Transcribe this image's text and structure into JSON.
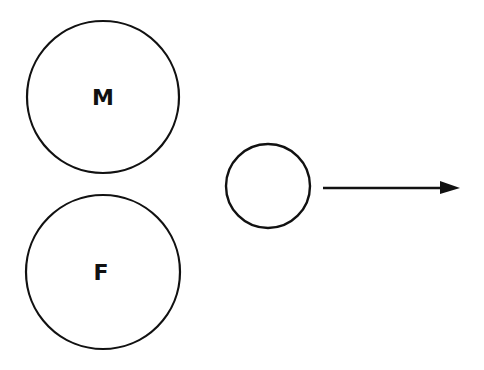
{
  "diagram": {
    "nodes": [
      {
        "id": "male",
        "label": "M",
        "cx": 103,
        "cy": 97,
        "r": 76
      },
      {
        "id": "female",
        "label": "F",
        "cx": 103,
        "cy": 272,
        "r": 77
      },
      {
        "id": "offspring",
        "label": "",
        "cx": 268,
        "cy": 186,
        "r": 42
      }
    ],
    "arrow": {
      "x1": 323,
      "y1": 188,
      "x2": 460,
      "y2": 188
    },
    "colors": {
      "stroke": "#111111",
      "background": "#ffffff"
    }
  }
}
